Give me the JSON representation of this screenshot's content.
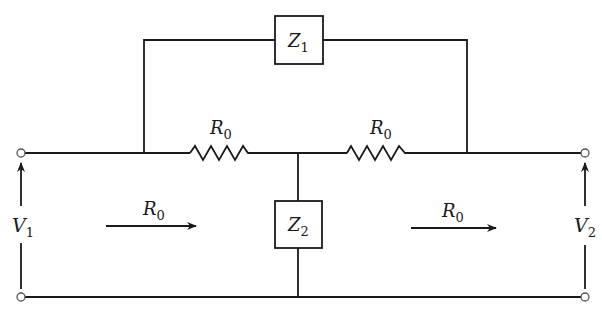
{
  "diagram": {
    "type": "bridged-T attenuator network",
    "components": {
      "z1": {
        "symbol": "Z",
        "subscript": "1"
      },
      "z2": {
        "symbol": "Z",
        "subscript": "2"
      },
      "r_left": {
        "symbol": "R",
        "subscript": "0"
      },
      "r_right": {
        "symbol": "R",
        "subscript": "0"
      }
    },
    "ports": {
      "input": {
        "symbol": "V",
        "subscript": "1"
      },
      "output": {
        "symbol": "V",
        "subscript": "2"
      }
    },
    "impedance_arrows": {
      "left": {
        "symbol": "R",
        "subscript": "0"
      },
      "right": {
        "symbol": "R",
        "subscript": "0"
      }
    }
  }
}
